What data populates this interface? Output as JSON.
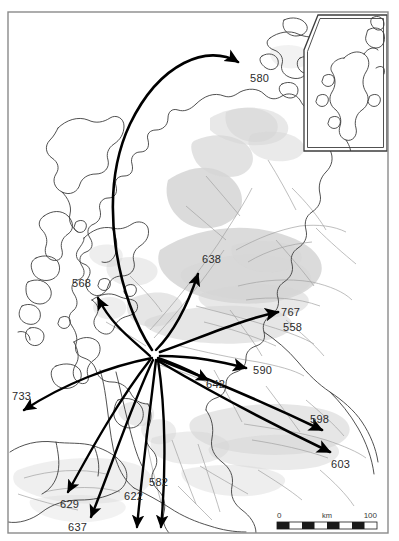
{
  "figure": {
    "region": "Scotland",
    "frame_color": "#8a8a8a",
    "background_color": "#ffffff",
    "coastline_color": "#3d3d3d",
    "inland_line_color": "#9a9a9a",
    "relief_color": "#d4d4d4",
    "arrow_color": "#000000",
    "label_color": "#2b2b2b"
  },
  "map_frame": {
    "x": 8,
    "y": 12,
    "width": 380,
    "height": 521
  },
  "inset": {
    "name": "shetland-inset",
    "x": 303,
    "y": 14,
    "width": 85,
    "height": 138,
    "label": ""
  },
  "flows": {
    "origin": {
      "x": 155,
      "y": 352,
      "name": "glasgow-clyde-hub"
    },
    "items": [
      {
        "id": "flow-580",
        "label": "580",
        "label_x": 250,
        "label_y": 82,
        "path": "M 152,350 C 118,300 96,196 130,124 C 160,62 208,44 238,62",
        "head_x": 241,
        "head_y": 63,
        "head_angle": -35,
        "destination": "orkney-north"
      },
      {
        "id": "flow-568",
        "label": "568",
        "label_x": 72,
        "label_y": 287,
        "path": "M 150,356 C 133,340 112,326 98,298",
        "head_x": 97,
        "head_y": 292,
        "head_angle": -62,
        "destination": "inner-hebrides-mull"
      },
      {
        "id": "flow-638",
        "label": "638",
        "label_x": 202,
        "label_y": 263,
        "path": "M 156,350 C 172,334 186,310 198,274",
        "head_x": 200,
        "head_y": 268,
        "head_angle": -70,
        "destination": "highland-north-east"
      },
      {
        "id": "flow-767",
        "label": "767",
        "label_x": 281,
        "label_y": 316,
        "path": "M 160,352 C 200,338 240,320 278,312",
        "head_x": 282,
        "head_y": 311,
        "head_angle": -10,
        "destination": "aberdeen-north-east"
      },
      {
        "id": "flow-558",
        "label": "558",
        "label_x": 283,
        "label_y": 331,
        "path": "",
        "head_x": 0,
        "head_y": 0,
        "head_angle": 0,
        "destination": "aberdeen-north-east"
      },
      {
        "id": "flow-590",
        "label": "590",
        "label_x": 253,
        "label_y": 374,
        "path": "M 160,356 C 196,356 222,362 246,368",
        "head_x": 250,
        "head_y": 369,
        "head_angle": 14,
        "destination": "tayside-perth"
      },
      {
        "id": "flow-642",
        "label": "642",
        "label_x": 206,
        "label_y": 388,
        "path": "M 158,358 C 182,366 196,374 208,380",
        "head_x": 212,
        "head_y": 382,
        "head_angle": 26,
        "destination": "stirling-forth"
      },
      {
        "id": "flow-598",
        "label": "598",
        "label_x": 310,
        "label_y": 423,
        "path": "M 160,360 C 216,382 272,406 322,430",
        "head_x": 326,
        "head_y": 432,
        "head_angle": 26,
        "destination": "lothian-edinburgh"
      },
      {
        "id": "flow-603",
        "label": "603",
        "label_x": 331,
        "label_y": 468,
        "path": "M 160,362 C 218,396 280,428 330,452",
        "head_x": 334,
        "head_y": 454,
        "head_angle": 27,
        "destination": "borders-south-east"
      },
      {
        "id": "flow-733",
        "label": "733",
        "label_x": 12,
        "label_y": 400,
        "path": "M 152,358 C 110,366 64,384 24,410",
        "head_x": 19,
        "head_y": 414,
        "head_angle": 148,
        "destination": "northern-ireland-west"
      },
      {
        "id": "flow-629",
        "label": "629",
        "label_x": 60,
        "label_y": 508,
        "path": "M 150,360 C 120,398 92,448 68,492",
        "head_x": 65,
        "head_y": 497,
        "head_angle": 118,
        "destination": "ayrshire-south-west"
      },
      {
        "id": "flow-637",
        "label": "637",
        "label_x": 68,
        "label_y": 531,
        "path": "M 153,360 C 132,404 110,470 91,517",
        "head_x": 89,
        "head_y": 522,
        "head_angle": 112,
        "destination": "dumfries-galloway"
      },
      {
        "id": "flow-622",
        "label": "622",
        "label_x": 124,
        "label_y": 500,
        "path": "M 156,360 C 150,410 142,472 137,527",
        "head_x": 137,
        "head_y": 532,
        "head_angle": 95,
        "destination": "solway-south"
      },
      {
        "id": "flow-582",
        "label": "582",
        "label_x": 149,
        "label_y": 486,
        "path": "M 158,360 C 166,412 166,474 161,527",
        "head_x": 161,
        "head_y": 532,
        "head_angle": 93,
        "destination": "england-south"
      }
    ]
  },
  "scale_bar": {
    "name": "scale-bar",
    "x": 277,
    "y": 522,
    "width": 100,
    "height": 7,
    "min_label": "0",
    "max_label": "100",
    "unit_label": "km",
    "segments": 8
  }
}
